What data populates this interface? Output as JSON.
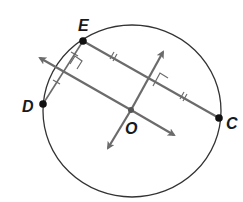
{
  "diagram": {
    "labels": {
      "E": "E",
      "D": "D",
      "C": "C",
      "O": "O"
    },
    "colors": {
      "circle": "#333333",
      "lines": "#6b6b6b",
      "points": "#111111"
    }
  }
}
